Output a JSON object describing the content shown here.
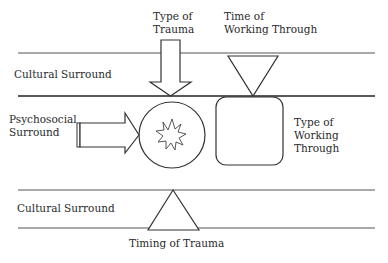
{
  "diagram": {
    "labels": {
      "type_of_trauma": "Type of\nTrauma",
      "time_of_working_through": "Time of\nWorking Through",
      "cultural_surround_top": "Cultural Surround",
      "psychosocial_surround": "Psychosocial\nSurround",
      "type_of_working_through": "Type of\nWorking\nThrough",
      "cultural_surround_bottom": "Cultural Surround",
      "timing_of_trauma": "Timing of Trauma"
    },
    "colors": {
      "line": "#333333",
      "background": "#ffffff"
    }
  }
}
